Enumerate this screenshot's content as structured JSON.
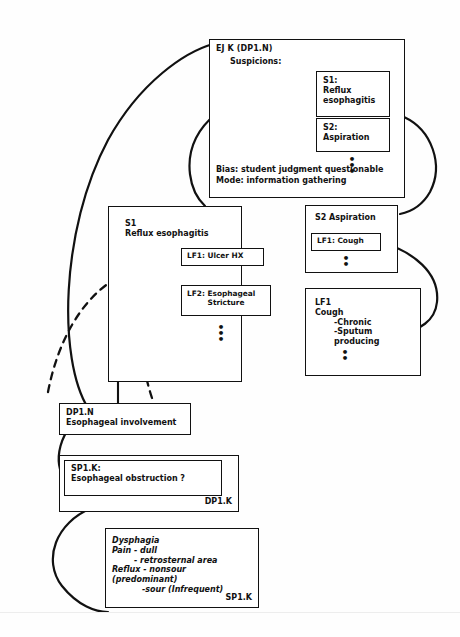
{
  "diagram": {
    "ellipsis_glyph": "•"
  },
  "nodes": {
    "ejk": {
      "label": "EJ K (DP1.N)",
      "subtitle": "Suspicions:",
      "bias": "Bias: student judgment questionable",
      "mode": "Mode: information gathering"
    },
    "s1_small": {
      "line1": "S1:",
      "line2": "Reflux",
      "line3": "esophagitis"
    },
    "s2_small": {
      "line1": "S2:",
      "line2": "Aspiration"
    },
    "s1_detail": {
      "line1": "S1",
      "line2": "Reflux esophagitis",
      "lf1": "LF1: Ulcer HX",
      "lf2_line1": "LF2: Esophageal",
      "lf2_line2": "Stricture"
    },
    "s2_detail": {
      "title": "S2  Aspiration",
      "lf1": "LF1: Cough"
    },
    "lf1_detail": {
      "line1": "LF1",
      "line2": "Cough",
      "line3": "-Chronic",
      "line4": "-Sputum producing"
    },
    "dp1n": {
      "line1": "DP1.N",
      "line2": "Esophageal involvement"
    },
    "dp1k": {
      "corner": "DP1.K",
      "sp1k_line1": "SP1.K:",
      "sp1k_line2": "Esophageal obstruction  ?"
    },
    "sp1k": {
      "line1": "Dysphagia",
      "line2": "Pain - dull",
      "line3": "- retrosternal area",
      "line4": "Reflux - nonsour (predominant)",
      "line5": "-sour (Infrequent)",
      "corner": "SP1.K"
    }
  },
  "colors": {
    "ink": "#111111",
    "paper": "#fefefe"
  }
}
